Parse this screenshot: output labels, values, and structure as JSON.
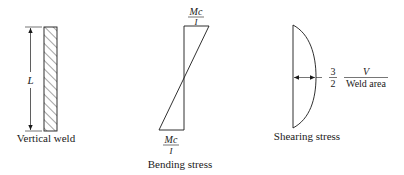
{
  "figure": {
    "panels": [
      {
        "id": "vertical-weld",
        "caption": "Vertical weld",
        "dimension_label": "L"
      },
      {
        "id": "bending-stress",
        "caption": "Bending stress",
        "top_label": {
          "numerator": "Mc",
          "denominator": "I"
        },
        "bottom_label": {
          "numerator": "Mc",
          "denominator": "I"
        }
      },
      {
        "id": "shearing-stress",
        "caption": "Shearing stress",
        "coefficient": {
          "numerator": "3",
          "denominator": "2"
        },
        "ratio": {
          "numerator": "V",
          "denominator": "Weld area"
        }
      }
    ],
    "colors": {
      "line": "#1a1a1a",
      "background": "#ffffff"
    }
  }
}
